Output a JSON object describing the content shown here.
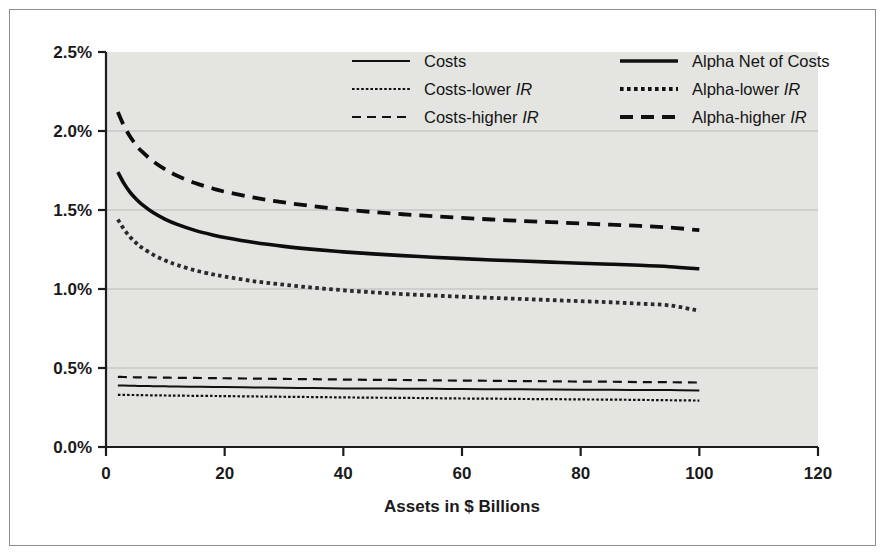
{
  "chart_data": {
    "type": "line",
    "title": "",
    "xlabel": "Assets in $ Billions",
    "ylabel": "",
    "xlim": [
      0,
      120
    ],
    "ylim": [
      0,
      0.025
    ],
    "grid": true,
    "legend_position": "top-center-inside",
    "x_ticks": [
      "0",
      "20",
      "40",
      "60",
      "80",
      "100",
      "120"
    ],
    "x_tick_values": [
      0,
      20,
      40,
      60,
      80,
      100,
      120
    ],
    "y_ticks": [
      "0.0%",
      "0.5%",
      "1.0%",
      "1.5%",
      "2.0%",
      "2.5%"
    ],
    "y_tick_values": [
      0.0,
      0.5,
      1.0,
      1.5,
      2.0,
      2.5
    ],
    "x": [
      2,
      3,
      4,
      5,
      6,
      8,
      10,
      12,
      15,
      18,
      20,
      25,
      30,
      35,
      40,
      45,
      50,
      55,
      60,
      65,
      70,
      75,
      80,
      85,
      90,
      95,
      100
    ],
    "series": [
      {
        "name": "Costs",
        "key": "costs",
        "style": "solid-thin",
        "color": "#111111",
        "values": [
          0.39,
          0.389,
          0.388,
          0.387,
          0.386,
          0.385,
          0.384,
          0.383,
          0.381,
          0.38,
          0.379,
          0.377,
          0.375,
          0.373,
          0.371,
          0.37,
          0.369,
          0.368,
          0.367,
          0.366,
          0.365,
          0.364,
          0.363,
          0.362,
          0.361,
          0.36,
          0.358
        ]
      },
      {
        "name": "Costs-lower",
        "name_suffix": "IR",
        "key": "costs_lower",
        "style": "dotted-thin",
        "color": "#111111",
        "values": [
          0.33,
          0.33,
          0.329,
          0.329,
          0.328,
          0.327,
          0.326,
          0.325,
          0.324,
          0.323,
          0.322,
          0.32,
          0.318,
          0.316,
          0.314,
          0.312,
          0.311,
          0.309,
          0.307,
          0.306,
          0.304,
          0.303,
          0.301,
          0.3,
          0.298,
          0.296,
          0.294
        ]
      },
      {
        "name": "Costs-higher",
        "name_suffix": "IR",
        "key": "costs_higher",
        "style": "dashed-thin",
        "color": "#111111",
        "values": [
          0.444,
          0.443,
          0.442,
          0.441,
          0.441,
          0.44,
          0.439,
          0.438,
          0.437,
          0.436,
          0.435,
          0.433,
          0.431,
          0.429,
          0.427,
          0.425,
          0.424,
          0.422,
          0.42,
          0.419,
          0.417,
          0.416,
          0.414,
          0.413,
          0.411,
          0.41,
          0.408
        ]
      },
      {
        "name": "Alpha Net of Costs",
        "key": "alpha_net",
        "style": "solid-thick",
        "color": "#0d0d0d",
        "values": [
          1.74,
          1.67,
          1.615,
          1.572,
          1.537,
          1.482,
          1.441,
          1.409,
          1.371,
          1.342,
          1.326,
          1.294,
          1.27,
          1.251,
          1.235,
          1.222,
          1.211,
          1.201,
          1.192,
          1.184,
          1.177,
          1.17,
          1.163,
          1.157,
          1.15,
          1.141,
          1.128
        ]
      },
      {
        "name": "Alpha-lower",
        "name_suffix": "IR",
        "key": "alpha_lower",
        "style": "dotted-thick",
        "color": "#2a2a2a",
        "values": [
          1.44,
          1.38,
          1.332,
          1.294,
          1.263,
          1.216,
          1.18,
          1.152,
          1.118,
          1.093,
          1.079,
          1.049,
          1.027,
          1.008,
          0.992,
          0.979,
          0.968,
          0.959,
          0.951,
          0.944,
          0.937,
          0.93,
          0.923,
          0.916,
          0.907,
          0.896,
          0.862
        ]
      },
      {
        "name": "Alpha-higher",
        "name_suffix": "IR",
        "key": "alpha_higher",
        "style": "dashed-thick",
        "color": "#0d0d0d",
        "values": [
          2.12,
          2.035,
          1.968,
          1.915,
          1.872,
          1.806,
          1.756,
          1.717,
          1.671,
          1.636,
          1.616,
          1.578,
          1.548,
          1.524,
          1.504,
          1.487,
          1.473,
          1.461,
          1.45,
          1.44,
          1.431,
          1.423,
          1.415,
          1.407,
          1.399,
          1.389,
          1.372
        ]
      }
    ],
    "legend_columns": [
      [
        {
          "label": "Costs",
          "italic_suffix": "",
          "style": "solid-thin"
        },
        {
          "label": "Costs-lower ",
          "italic_suffix": "IR",
          "style": "dotted-thin"
        },
        {
          "label": "Costs-higher ",
          "italic_suffix": "IR",
          "style": "dashed-thin"
        }
      ],
      [
        {
          "label": "Alpha Net of Costs",
          "italic_suffix": "",
          "style": "solid-thick"
        },
        {
          "label": "Alpha-lower ",
          "italic_suffix": "IR",
          "style": "dotted-thick"
        },
        {
          "label": "Alpha-higher ",
          "italic_suffix": "IR",
          "style": "dashed-thick"
        }
      ]
    ],
    "colors": {
      "plot_background": "#e4e4e1",
      "frame": "#8d8d8a",
      "axis": "#1c1c1c",
      "gridline": "#b9b9b5",
      "text": "#1a1a1a"
    }
  }
}
